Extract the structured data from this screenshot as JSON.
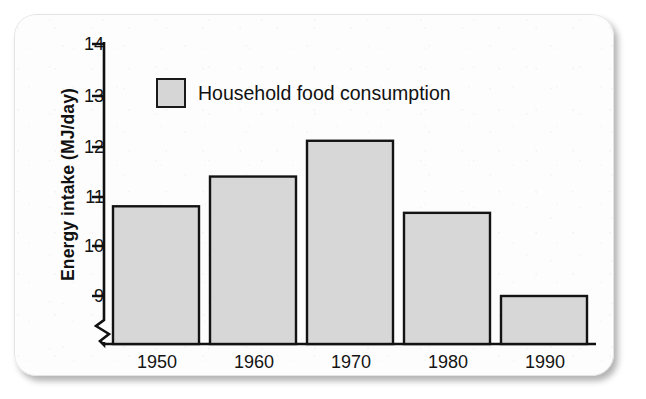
{
  "chart_data": {
    "type": "bar",
    "title": "",
    "subtitle": "",
    "xlabel": "",
    "ylabel": "Energy intake (MJ/day)",
    "categories": [
      "1950",
      "1960",
      "1970",
      "1980",
      "1990"
    ],
    "values": [
      10.78,
      11.37,
      12.08,
      10.65,
      9.0
    ],
    "series": [
      {
        "name": "Household food consumption",
        "values": [
          10.78,
          11.37,
          12.08,
          10.65,
          9.0
        ]
      }
    ],
    "ylim": [
      8.5,
      14
    ],
    "ytick_labels": [
      "9",
      "10",
      "11",
      "12",
      "13",
      "14"
    ],
    "ytick_values": [
      9,
      10,
      11,
      12,
      13,
      14
    ],
    "xtick_labels": [
      "1950",
      "1960",
      "1970",
      "1980",
      "1990"
    ],
    "grid": false,
    "legend": {
      "position": "upper-left-inside",
      "entries": [
        {
          "label": "Household food consumption",
          "color": "#d7d7d7"
        }
      ]
    },
    "annotations": [
      {
        "name": "y-axis-break",
        "description": "zigzag axis break below 9"
      }
    ],
    "colors": {
      "bar_fill": "#d7d7d7",
      "bar_stroke": "#131313",
      "axis": "#111111",
      "text": "#141414",
      "card_background": "#fdfdfd",
      "page_background": "#ffffff"
    }
  },
  "axis": {
    "y_title": "Energy intake (MJ/day)",
    "y_ticks": [
      {
        "label": "14",
        "value": 14
      },
      {
        "label": "13",
        "value": 13
      },
      {
        "label": "12",
        "value": 12
      },
      {
        "label": "11",
        "value": 11
      },
      {
        "label": "10",
        "value": 10
      },
      {
        "label": "9",
        "value": 9
      }
    ],
    "x_ticks": [
      {
        "label": "1950"
      },
      {
        "label": "1960"
      },
      {
        "label": "1970"
      },
      {
        "label": "1980"
      },
      {
        "label": "1990"
      }
    ]
  },
  "legend": {
    "label": "Household food consumption"
  }
}
